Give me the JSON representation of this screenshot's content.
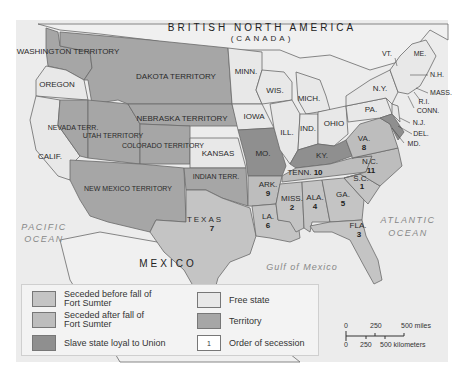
{
  "map": {
    "colors": {
      "ocean": "#ececec",
      "foreign_land": "#f0f0f0",
      "free_state": "#e8e8e8",
      "territory": "#a6a6a6",
      "seceded_before": "#c4c4c4",
      "seceded_after": "#bdbdbd",
      "slave_loyal": "#8f8f8f",
      "border": "#6a6a6a"
    },
    "headings": {
      "north": "BRITISH NORTH AMERICA",
      "north_sub": "(CANADA)",
      "south": "MEXICO"
    },
    "water": {
      "pacific_1": "PACIFIC",
      "pacific_2": "OCEAN",
      "atlantic_1": "ATLANTIC",
      "atlantic_2": "OCEAN",
      "gulf": "Gulf of Mexico"
    },
    "regions": [
      {
        "name": "WASHINGTON TERRITORY",
        "status": "territory"
      },
      {
        "name": "OREGON",
        "status": "free_state"
      },
      {
        "name": "CALIF.",
        "status": "free_state"
      },
      {
        "name": "NEVADA TERR.",
        "status": "territory"
      },
      {
        "name": "UTAH TERRITORY",
        "status": "territory"
      },
      {
        "name": "DAKOTA TERRITORY",
        "status": "territory"
      },
      {
        "name": "NEBRASKA TERRITORY",
        "status": "territory"
      },
      {
        "name": "COLORADO TERRITORY",
        "status": "territory"
      },
      {
        "name": "NEW MEXICO TERRITORY",
        "status": "territory"
      },
      {
        "name": "KANSAS",
        "status": "free_state"
      },
      {
        "name": "INDIAN TERR.",
        "status": "territory"
      },
      {
        "name": "MINN.",
        "status": "free_state"
      },
      {
        "name": "IOWA",
        "status": "free_state"
      },
      {
        "name": "MO.",
        "status": "slave_loyal"
      },
      {
        "name": "WIS.",
        "status": "free_state"
      },
      {
        "name": "ILL.",
        "status": "free_state"
      },
      {
        "name": "MICH.",
        "status": "free_state"
      },
      {
        "name": "IND.",
        "status": "free_state"
      },
      {
        "name": "OHIO",
        "status": "free_state"
      },
      {
        "name": "KY.",
        "status": "slave_loyal"
      },
      {
        "name": "PA.",
        "status": "free_state"
      },
      {
        "name": "N.Y.",
        "status": "free_state"
      },
      {
        "name": "VT.",
        "status": "free_state"
      },
      {
        "name": "ME.",
        "status": "free_state"
      },
      {
        "name": "N.H.",
        "status": "free_state"
      },
      {
        "name": "MASS.",
        "status": "free_state"
      },
      {
        "name": "R.I.",
        "status": "free_state"
      },
      {
        "name": "CONN.",
        "status": "free_state"
      },
      {
        "name": "N.J.",
        "status": "free_state"
      },
      {
        "name": "DEL.",
        "status": "slave_loyal"
      },
      {
        "name": "MD.",
        "status": "slave_loyal"
      },
      {
        "name": "TEXAS",
        "status": "seceded_before",
        "order": "7"
      },
      {
        "name": "LA.",
        "status": "seceded_before",
        "order": "6"
      },
      {
        "name": "MISS.",
        "status": "seceded_before",
        "order": "2"
      },
      {
        "name": "ALA.",
        "status": "seceded_before",
        "order": "4"
      },
      {
        "name": "GA.",
        "status": "seceded_before",
        "order": "5"
      },
      {
        "name": "FLA.",
        "status": "seceded_before",
        "order": "3"
      },
      {
        "name": "S.C.",
        "status": "seceded_before",
        "order": "1"
      },
      {
        "name": "ARK.",
        "status": "seceded_after",
        "order": "9"
      },
      {
        "name": "TENN.",
        "status": "seceded_after",
        "order": "10"
      },
      {
        "name": "N.C.",
        "status": "seceded_after",
        "order": "11"
      },
      {
        "name": "VA.",
        "status": "seceded_after",
        "order": "8"
      }
    ]
  },
  "legend": {
    "items": [
      {
        "label_1": "Seceded before fall of",
        "label_2": "Fort Sumter",
        "swatch": "#c4c4c4"
      },
      {
        "label_1": "Seceded after fall of",
        "label_2": "Fort Sumter",
        "swatch": "#bdbdbd"
      },
      {
        "label_1": "Slave state loyal to Union",
        "label_2": "",
        "swatch": "#8f8f8f"
      },
      {
        "label_1": "Free state",
        "label_2": "",
        "swatch": "#e8e8e8"
      },
      {
        "label_1": "Territory",
        "label_2": "",
        "swatch": "#a6a6a6"
      },
      {
        "label_1": "Order of secession",
        "label_2": "",
        "swatch": "#ffffff",
        "swatch_text": "1"
      }
    ]
  },
  "scale": {
    "miles_0": "0",
    "miles_250": "250",
    "miles_500": "500 miles",
    "km_0": "0",
    "km_250": "250",
    "km_500": "500 kilometers"
  }
}
